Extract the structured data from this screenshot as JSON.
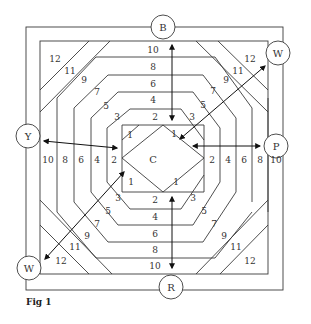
{
  "figure": {
    "caption": "Fig 1",
    "center_label": "C",
    "edge_labels": {
      "top": "B",
      "right": "P",
      "bottom": "R",
      "left": "Y",
      "top_right": "W",
      "bottom_left": "W"
    },
    "strip_numbers": {
      "top": [
        "10",
        "8",
        "6",
        "4",
        "2"
      ],
      "bottom": [
        "2",
        "4",
        "6",
        "8",
        "10"
      ],
      "left": [
        "10",
        "8",
        "6",
        "4",
        "2"
      ],
      "right": [
        "2",
        "4",
        "6",
        "8",
        "10"
      ],
      "center_corners": [
        "1",
        "1",
        "1",
        "1"
      ],
      "diagonal_top_left": [
        "12",
        "11",
        "9",
        "7",
        "5",
        "3"
      ],
      "diagonal_top_right": [
        "12",
        "11",
        "9",
        "7",
        "5",
        "3"
      ],
      "diagonal_bottom_left": [
        "12",
        "11",
        "9",
        "7",
        "5",
        "3"
      ],
      "diagonal_bottom_right": [
        "12",
        "11",
        "9",
        "7",
        "5",
        "3"
      ]
    }
  }
}
